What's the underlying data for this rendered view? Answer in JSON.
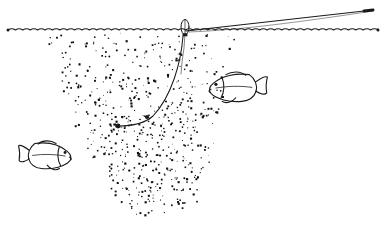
{
  "illustration": {
    "title": "Chum slick fishing diagram",
    "style": "pen-and-ink line drawing",
    "background_color": "#ffffff",
    "ink_color": "#1a1a1a",
    "canvas": {
      "width": 389,
      "height": 225
    }
  },
  "scene": {
    "water_surface": {
      "name": "water-surface-wave-line",
      "label": "Water surface",
      "y": 30,
      "x_start": 8,
      "x_end": 378,
      "wave_amplitude": 2.6,
      "wave_period": 7.4,
      "stroke_width": 1.1
    },
    "fishing_rod": {
      "name": "fishing-rod-line",
      "label": "Fishing rod and line above water",
      "tip_x": 373,
      "tip_y": 10,
      "base_x": 186,
      "base_y": 31,
      "stroke_width": 1.2,
      "tip_marker_length": 9
    },
    "float": {
      "name": "fishing-float",
      "label": "Float / bobber",
      "cx": 185,
      "cy": 27,
      "rx": 4.0,
      "ry": 7.5,
      "stroke_width": 1.0
    },
    "dropper_line": {
      "name": "dropper-line",
      "label": "Vertical dropper line under float",
      "points": "185,34 184,48 182,62 181,74"
    },
    "leader_line": {
      "name": "baited-leader-line",
      "label": "Curved baited leader line",
      "path": "M 183,36 C 181,62 172,96 153,116 C 144,124 130,126 118,126",
      "stroke_width": 1.05
    },
    "hook_markers": [
      {
        "name": "hook-marker-upper",
        "cx": 147,
        "cy": 117,
        "r": 2.1
      },
      {
        "name": "hook-marker-lower",
        "cx": 118,
        "cy": 126,
        "r": 2.4
      }
    ],
    "chum_cloud": {
      "name": "chum-cloud",
      "label": "Chum slick / bait particle cloud",
      "top_y": 33,
      "bottom_y": 216,
      "top_left_x": 45,
      "top_right_x": 232,
      "bottom_left_x": 128,
      "bottom_right_x": 190,
      "particle_count": 640,
      "particle_min_size": 0.8,
      "particle_max_size": 2.2,
      "seed": 20240517
    },
    "fish": [
      {
        "name": "fish-lower-left",
        "label": "Fish approaching slick from lower left",
        "facing": "right",
        "x": 18,
        "y": 140,
        "length": 56,
        "height": 32,
        "scale": 1.0
      },
      {
        "name": "fish-right-feeding",
        "label": "Fish feeding at edge of chum slick",
        "facing": "left",
        "x": 206,
        "y": 71,
        "length": 62,
        "height": 34,
        "scale": 1.05
      }
    ]
  }
}
